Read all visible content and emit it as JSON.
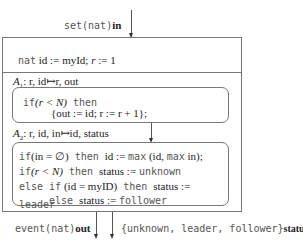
{
  "input": {
    "keyword": "set",
    "type": "(nat)",
    "name": "in"
  },
  "init": {
    "keyword": "nat",
    "code": " id := myId; ",
    "r": "r",
    "rest": " := 1"
  },
  "action1": {
    "label": "A",
    "sub": "1",
    "signature": ": r, id↦r, out",
    "line1_kw": "if",
    "line1_cond": "(r < N)",
    "line1_then": " then",
    "line2": "{out := id; r := r + 1};"
  },
  "action2": {
    "label": "A",
    "sub": "2",
    "signature": ": r, id, in↦id, status",
    "lines": [
      {
        "kw": "if",
        "cond": "(in = ∅)",
        "then": " then ",
        "body": "id := ",
        "fn": "max",
        "body2": " (id, ",
        "fn2": "max",
        "body3": " in);"
      },
      {
        "kw": "if",
        "cond": "(r < N)",
        "then": " then ",
        "body": "status := ",
        "val": "unknown"
      },
      {
        "kw": "else if",
        "cond": " (id = myID)",
        "then": " then ",
        "body": "status := ",
        "val": "leader"
      },
      {
        "kw": "else ",
        "body": "status := ",
        "val": "follower"
      }
    ]
  },
  "outputs": {
    "out": {
      "keyword": "event",
      "type": "(nat)",
      "name": "out"
    },
    "status": {
      "type": "{unknown, leader, follower}",
      "name": "status"
    }
  },
  "colors": {
    "border": "#777777",
    "text": "#222222",
    "mono_text": "#555555"
  }
}
